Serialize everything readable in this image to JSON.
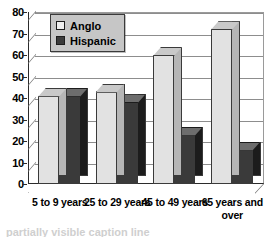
{
  "chart_data": {
    "type": "bar",
    "title": "",
    "xlabel": "",
    "ylabel": "",
    "ylim": [
      0,
      80
    ],
    "ytick_step": 10,
    "yticks": [
      "0",
      "10",
      "20",
      "30",
      "40",
      "50",
      "60",
      "70",
      "80"
    ],
    "grid": true,
    "legend_position": "top-left-inside",
    "style": "3d-clustered-column",
    "categories": [
      "5 to 9 years",
      "25 to 29 years",
      "45 to 49 years",
      "65 years and over"
    ],
    "series": [
      {
        "name": "Anglo",
        "color": "#e2e2e2",
        "values": [
          41,
          43,
          60,
          72
        ]
      },
      {
        "name": "Hispanic",
        "color": "#3a3a3a",
        "values": [
          41,
          38,
          23,
          16
        ]
      }
    ]
  },
  "legend": {
    "items": [
      {
        "label": "Anglo",
        "swatch": "light-square-swatch"
      },
      {
        "label": "Hispanic",
        "swatch": "dark-square-swatch"
      }
    ]
  },
  "caption": {
    "clipped_text": "partially visible caption line"
  }
}
